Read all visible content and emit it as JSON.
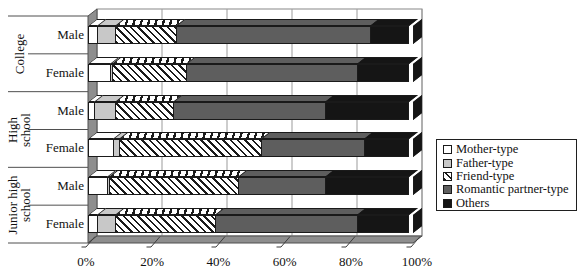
{
  "chart_data": {
    "type": "bar",
    "stacked": true,
    "orientation": "horizontal",
    "style": "3d",
    "x_axis": {
      "ticks": [
        "0%",
        "20%",
        "40%",
        "60%",
        "80%",
        "100%"
      ],
      "min": 0,
      "max": 100,
      "unit": "%",
      "grid": true
    },
    "groups": [
      {
        "label": "College",
        "label_lines": [
          "College"
        ],
        "rows": [
          "Male",
          "Female"
        ]
      },
      {
        "label": "High school",
        "label_lines": [
          "High",
          "school"
        ],
        "rows": [
          "Male",
          "Female"
        ]
      },
      {
        "label": "Junior high school",
        "label_lines": [
          "Junior high",
          "school"
        ],
        "rows": [
          "Male",
          "Female"
        ]
      }
    ],
    "categories": [
      "College Male",
      "College Female",
      "High school Male",
      "High school Female",
      "Junior high school Male",
      "Junior high school Female"
    ],
    "series": [
      {
        "name": "Mother-type",
        "pattern": "white",
        "values": [
          3,
          7,
          2,
          8,
          6,
          3
        ]
      },
      {
        "name": "Father-type",
        "pattern": "lightgray",
        "values": [
          6,
          1,
          7,
          2,
          1,
          6
        ]
      },
      {
        "name": "Friend-type",
        "pattern": "hatch",
        "values": [
          19,
          23,
          18,
          44,
          40,
          31
        ]
      },
      {
        "name": "Romantic partner-type",
        "pattern": "darkgray",
        "values": [
          60,
          53,
          47,
          32,
          27,
          44
        ]
      },
      {
        "name": "Others",
        "pattern": "black",
        "values": [
          12,
          16,
          26,
          14,
          26,
          16
        ]
      }
    ],
    "legend": {
      "position": "right",
      "items": [
        "Mother-type",
        "Father-type",
        "Friend-type",
        "Romantic partner-type",
        "Others"
      ]
    },
    "colors": {
      "white": "#ffffff",
      "lightgray": "#c8c8c8",
      "darkgray": "#5e5e5e",
      "black": "#151515",
      "hatch_fg": "#1a1a1a",
      "hatch_bg": "#ffffff",
      "wall": "#8e8e8e",
      "outline": "#1a1a1a",
      "gridline": "#9b9b9b"
    }
  }
}
